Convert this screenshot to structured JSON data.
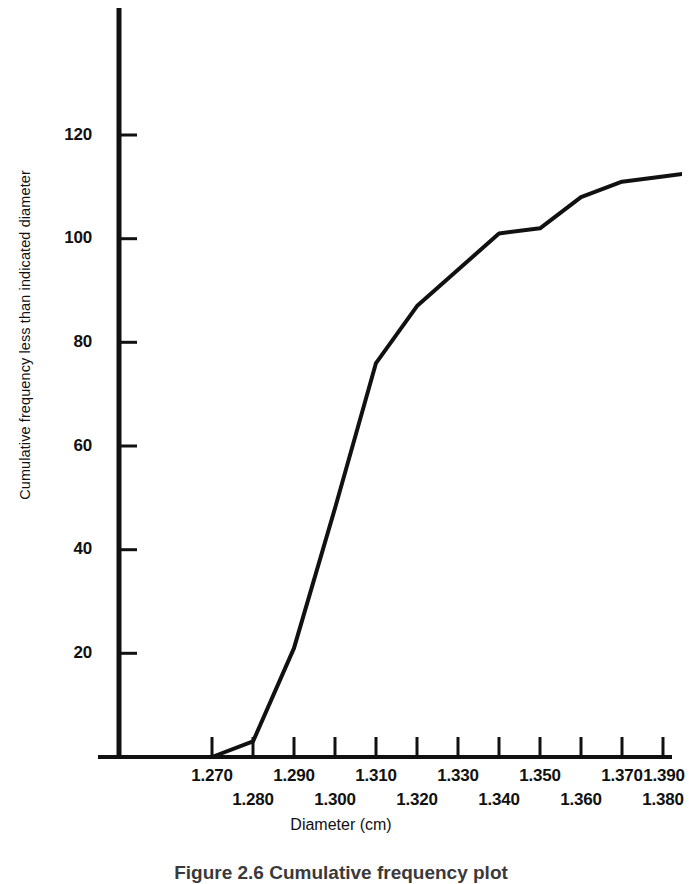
{
  "figure": {
    "caption": "Figure 2.6   Cumulative frequency plot",
    "background_color": "#ffffff",
    "ink_color": "#111111"
  },
  "axes": {
    "x_title": "Diameter (cm)",
    "y_title": "Cumulative frequency less than indicated diameter",
    "x_tick_labels_upper": [
      "1.270",
      "1.290",
      "1.310",
      "1.330",
      "1.350",
      "1.370",
      "1.390"
    ],
    "x_tick_labels_lower": [
      "1.280",
      "1.300",
      "1.320",
      "1.340",
      "1.360",
      "1.380"
    ],
    "y_tick_labels": [
      "20",
      "40",
      "60",
      "80",
      "100",
      "120"
    ]
  },
  "chart_data": {
    "type": "line",
    "title": "Figure 2.6   Cumulative frequency plot",
    "xlabel": "Diameter (cm)",
    "ylabel": "Cumulative frequency less than indicated diameter",
    "xlim": [
      1.265,
      1.395
    ],
    "ylim": [
      0,
      135
    ],
    "xticks": [
      1.27,
      1.28,
      1.29,
      1.3,
      1.31,
      1.32,
      1.33,
      1.34,
      1.35,
      1.36,
      1.37,
      1.38,
      1.39
    ],
    "yticks": [
      20,
      40,
      60,
      80,
      100,
      120
    ],
    "grid": false,
    "legend": "none",
    "line_color": "#111111",
    "line_width": 4,
    "x": [
      1.27,
      1.28,
      1.29,
      1.3,
      1.31,
      1.32,
      1.33,
      1.34,
      1.35,
      1.36,
      1.37,
      1.38,
      1.39
    ],
    "values": [
      0,
      3,
      21,
      48,
      76,
      87,
      94,
      101,
      102,
      108,
      111,
      112,
      113
    ],
    "series": [
      {
        "name": "Cumulative frequency",
        "values": [
          0,
          3,
          21,
          48,
          76,
          87,
          94,
          101,
          102,
          108,
          111,
          112,
          113
        ]
      }
    ]
  }
}
